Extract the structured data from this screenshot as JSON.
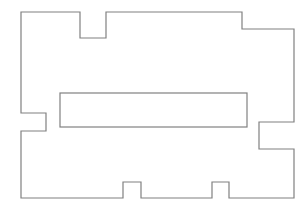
{
  "canvas": {
    "width": 308,
    "height": 211,
    "background": "#ffffff"
  },
  "style": {
    "stroke": "#808080",
    "stroke_width": 1.2
  },
  "shapes": {
    "outer_boundary": {
      "type": "polygon",
      "points": [
        [
          21,
          12
        ],
        [
          80,
          12
        ],
        [
          80,
          38
        ],
        [
          106,
          38
        ],
        [
          106,
          12
        ],
        [
          242,
          12
        ],
        [
          242,
          29
        ],
        [
          294,
          29
        ],
        [
          294,
          122
        ],
        [
          259,
          122
        ],
        [
          259,
          149
        ],
        [
          294,
          149
        ],
        [
          294,
          198
        ],
        [
          229,
          198
        ],
        [
          229,
          182
        ],
        [
          212,
          182
        ],
        [
          212,
          198
        ],
        [
          141,
          198
        ],
        [
          141,
          182
        ],
        [
          123,
          182
        ],
        [
          123,
          198
        ],
        [
          21,
          198
        ],
        [
          21,
          131
        ],
        [
          46,
          131
        ],
        [
          46,
          113
        ],
        [
          21,
          113
        ]
      ]
    },
    "inner_rectangle": {
      "type": "rect",
      "x": 60,
      "y": 93,
      "width": 187,
      "height": 34
    }
  }
}
